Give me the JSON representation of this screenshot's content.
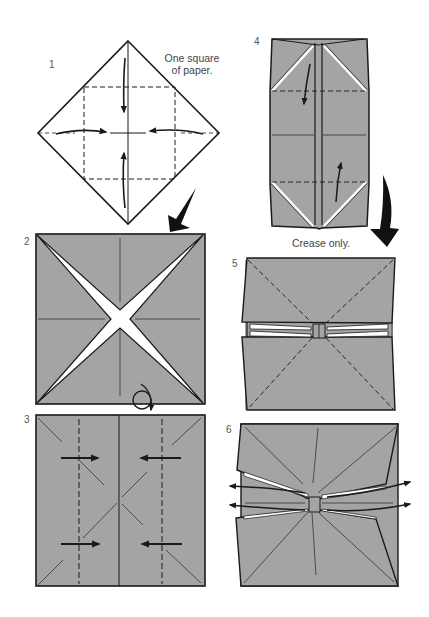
{
  "diagram": {
    "colors": {
      "paper": "#a4a4a4",
      "line": "#1a1a1a",
      "background": "#ffffff",
      "gap": "#ffffff"
    },
    "steps": [
      {
        "number": "1",
        "note_line1": "One square",
        "note_line2": "of paper."
      },
      {
        "number": "2"
      },
      {
        "number": "3"
      },
      {
        "number": "4",
        "note": "Crease only."
      },
      {
        "number": "5"
      },
      {
        "number": "6"
      }
    ]
  }
}
